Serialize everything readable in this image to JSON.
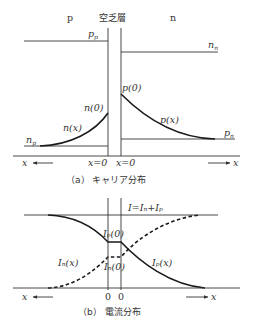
{
  "figure_a": {
    "region_labels": {
      "p": "p",
      "depletion": "空乏層",
      "n": "n"
    },
    "levels": {
      "pp": "p",
      "pp_sub": "p",
      "nn": "n",
      "nn_sub": "n",
      "np": "n",
      "np_sub": "p",
      "pn": "p",
      "pn_sub": "n"
    },
    "curve_labels": {
      "n0": "n(0)",
      "nx": "n(x)",
      "p0": "p(0)",
      "px": "p(x)"
    },
    "axis": {
      "left": "x",
      "right": "x",
      "origin_left": "x=0",
      "origin_right": "x=0"
    },
    "caption": "（a） キャリア分布"
  },
  "figure_b": {
    "total_current": "I=Iₙ+Iₚ",
    "labels": {
      "ip0": "Iₚ(0)",
      "in0": "Iₙ(0)",
      "inx": "Iₙ(x)",
      "ipx": "Iₚ(x)"
    },
    "axis": {
      "left": "x",
      "right": "x",
      "origin_left": "0",
      "origin_right": "0"
    },
    "caption": "（b） 電流分布"
  }
}
